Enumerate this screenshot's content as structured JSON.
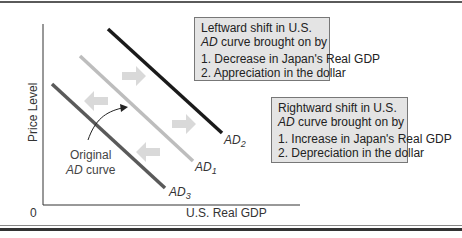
{
  "axes": {
    "y_label": "Price Level",
    "x_label": "U.S. Real GDP",
    "origin": "0"
  },
  "curves": [
    {
      "id": "AD1",
      "label_main": "AD",
      "label_sub": "1",
      "color": "#bdbdbd",
      "role": "original"
    },
    {
      "id": "AD2",
      "label_main": "AD",
      "label_sub": "2",
      "color": "#1a1a1a",
      "role": "rightward shift"
    },
    {
      "id": "AD3",
      "label_main": "AD",
      "label_sub": "3",
      "color": "#5a5a5a",
      "role": "leftward shift"
    }
  ],
  "original_annotation": {
    "line1": "Original",
    "line2_italic": "AD",
    "line2_rest": " curve"
  },
  "left_box": {
    "line1": "Leftward shift in U.S.",
    "line2_italic": "AD",
    "line2_rest": " curve brought on by",
    "items": [
      "1. Decrease in Japan's Real GDP",
      "2. Appreciation in the dollar"
    ]
  },
  "right_box": {
    "line1": "Rightward shift in U.S.",
    "line2_italic": "AD",
    "line2_rest": " curve brought on by",
    "items": [
      "1. Increase in Japan's Real GDP",
      "2. Depreciation in the dollar"
    ]
  },
  "colors": {
    "box_fill": "#e4e4e4",
    "arrow_fill": "#d9d9d9",
    "axis": "#333333"
  }
}
